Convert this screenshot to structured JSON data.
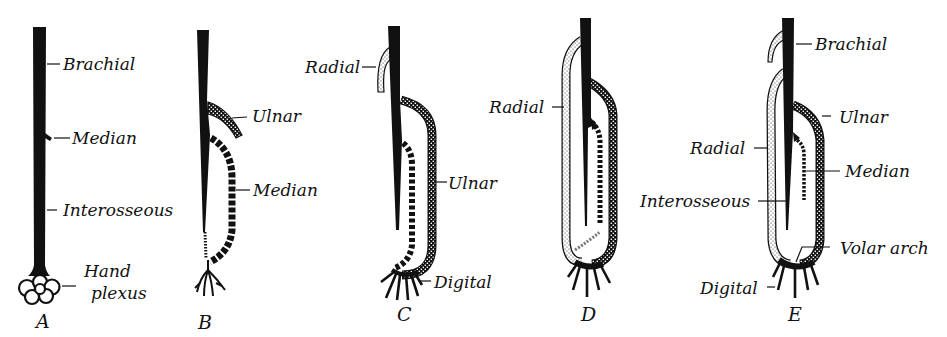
{
  "figure": {
    "colors": {
      "ink": "#111111",
      "background": "#ffffff"
    },
    "legend_patterns": {
      "brachial_interosseous": "solid black",
      "median": "black dashed segments",
      "ulnar": "dense dotted (checkered)",
      "radial": "light stippled"
    },
    "panels": [
      {
        "id": "A",
        "label": "A",
        "vessels": [
          {
            "name": "Brachial",
            "label": "Brachial"
          },
          {
            "name": "Median",
            "label": "Median"
          },
          {
            "name": "Interosseous",
            "label": "Interosseous"
          },
          {
            "name": "Hand plexus",
            "label_line1": "Hand",
            "label_line2": "plexus"
          }
        ]
      },
      {
        "id": "B",
        "label": "B",
        "vessels": [
          {
            "name": "Ulnar",
            "label": "Ulnar"
          },
          {
            "name": "Median",
            "label": "Median"
          }
        ]
      },
      {
        "id": "C",
        "label": "C",
        "vessels": [
          {
            "name": "Radial",
            "label": "Radial"
          },
          {
            "name": "Ulnar",
            "label": "Ulnar"
          },
          {
            "name": "Digital",
            "label": "Digital"
          }
        ]
      },
      {
        "id": "D",
        "label": "D",
        "vessels": [
          {
            "name": "Radial",
            "label": "Radial"
          }
        ]
      },
      {
        "id": "E",
        "label": "E",
        "vessels": [
          {
            "name": "Brachial",
            "label": "Brachial"
          },
          {
            "name": "Ulnar",
            "label": "Ulnar"
          },
          {
            "name": "Radial",
            "label": "Radial"
          },
          {
            "name": "Median",
            "label": "Median"
          },
          {
            "name": "Interosseous",
            "label": "Interosseous"
          },
          {
            "name": "Volar arch",
            "label": "Volar arch"
          },
          {
            "name": "Digital",
            "label": "Digital"
          }
        ]
      }
    ]
  }
}
